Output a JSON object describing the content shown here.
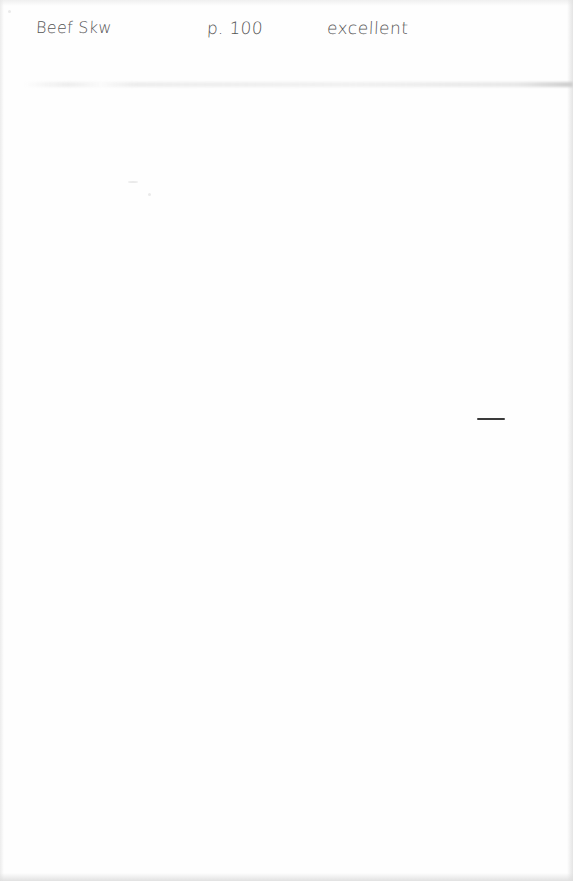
{
  "document": {
    "type": "handwritten note (scanned)",
    "entries": [
      {
        "item": "Beef Skw",
        "page": "p. 100",
        "rating": "excellent"
      }
    ],
    "marks": [
      {
        "type": "pen-dash",
        "position": "right margin, mid-page"
      }
    ],
    "colors": {
      "paper": "#fefefe",
      "ink": "#555555",
      "dash_ink": "#3a3a3a"
    }
  }
}
